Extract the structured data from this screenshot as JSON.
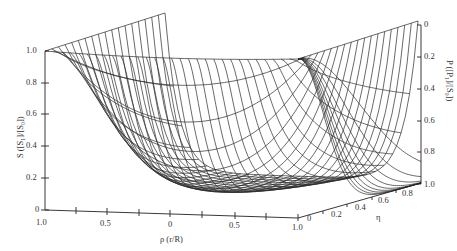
{
  "figure": {
    "type": "3d-wireframe-surface",
    "left_axis": {
      "title": "S ([S₁]/[S₀])",
      "ticks": [
        "1.0",
        "0.8",
        "0.6",
        "0.4",
        "0.2",
        "0"
      ]
    },
    "right_axis": {
      "title": "P ([P₁]/[S₀])",
      "ticks": [
        "0",
        "0.2",
        "0.4",
        "0.6",
        "0.8",
        "1.0"
      ]
    },
    "rho_axis": {
      "title": "ρ (r/R)",
      "ticks": [
        "1.0",
        "0.5",
        "0",
        "0.5",
        "1.0"
      ]
    },
    "eta_axis": {
      "title": "η",
      "ticks": [
        "0",
        "0.2",
        "0.4",
        "0.6",
        "0.8",
        "1.0"
      ]
    }
  },
  "chart_data": {
    "type": "surface",
    "title": "",
    "xlabel": "ρ (r/R)",
    "ylabel": "η",
    "zlabel_left": "S ([S₁]/[S₀])",
    "zlabel_right": "P ([P₁]/[S₀])",
    "x_ticks": [
      1.0,
      0.5,
      0,
      0.5,
      1.0
    ],
    "y_ticks": [
      0,
      0.2,
      0.4,
      0.6,
      0.8,
      1.0
    ],
    "z_left_ticks": [
      0,
      0.2,
      0.4,
      0.6,
      0.8,
      1.0
    ],
    "z_right_ticks": [
      0,
      0.2,
      0.4,
      0.6,
      0.8,
      1.0
    ],
    "xlim": [
      -1.0,
      1.0
    ],
    "ylim": [
      0,
      1.0
    ],
    "zlim": [
      0,
      1.0
    ]
  }
}
